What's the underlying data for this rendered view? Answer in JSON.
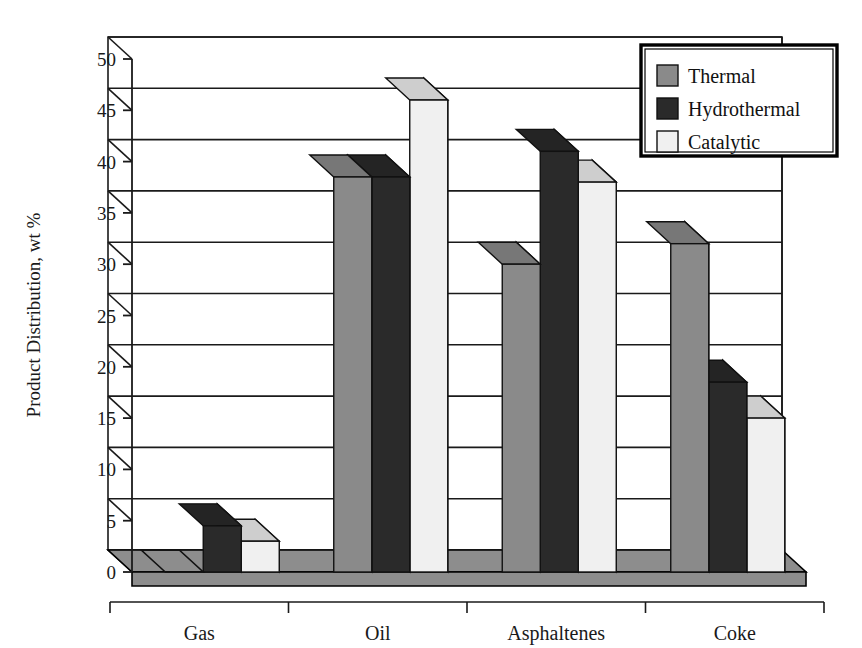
{
  "chart_data": {
    "type": "bar",
    "title": "",
    "subtitle": "",
    "xlabel": "",
    "ylabel": "Product Distribution, wt %",
    "categories": [
      "Gas",
      "Oil",
      "Asphaltenes",
      "Coke"
    ],
    "series": [
      {
        "name": "Thermal",
        "color": "#8a8a8a",
        "values": [
          0,
          38.5,
          30,
          32
        ]
      },
      {
        "name": "Hydrothermal",
        "color": "#2a2a2a",
        "values": [
          4.5,
          38.5,
          41,
          18.5
        ]
      },
      {
        "name": "Catalytic",
        "color": "#f0f0f0",
        "values": [
          3,
          46,
          38,
          15
        ]
      }
    ],
    "ylim": [
      0,
      50
    ],
    "ytick_step": 5,
    "yticks": [
      0,
      5,
      10,
      15,
      20,
      25,
      30,
      35,
      40,
      45,
      50
    ],
    "ytick_labels": [
      "0",
      "5",
      "10",
      "15",
      "20",
      "25",
      "30",
      "35",
      "40",
      "45",
      "50"
    ],
    "grid": true,
    "grid_axis": "y",
    "legend_position": "top-right",
    "style": "3d-bar",
    "annotations": []
  },
  "legend": {
    "entries": [
      {
        "label": "Thermal",
        "swatch_color": "#8a8a8a"
      },
      {
        "label": "Hydrothermal",
        "swatch_color": "#2a2a2a"
      },
      {
        "label": "Catalytic",
        "swatch_color": "#f0f0f0"
      }
    ]
  },
  "colors": {
    "floor": "#8d8d8d",
    "floor_edge": "#000000",
    "axis": "#1a1a1a",
    "grid": "#1a1a1a",
    "background": "#ffffff",
    "legend_border": "#000000",
    "legend_fill": "#ffffff"
  }
}
